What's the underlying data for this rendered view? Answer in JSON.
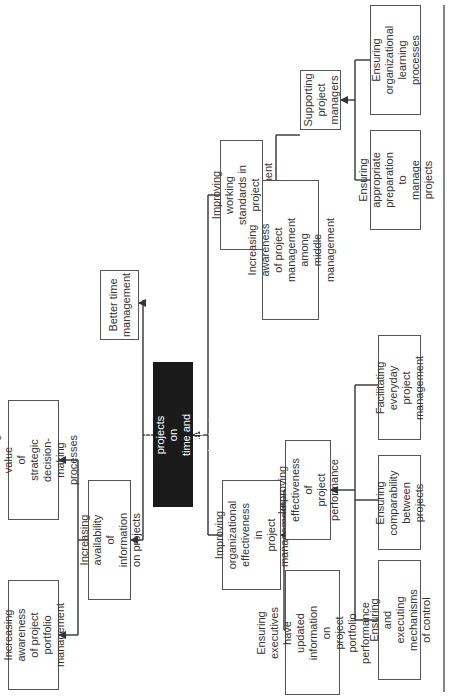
{
  "diagram": {
    "orientation": "rotated-90-ccw",
    "root": {
      "label": "Complete more projects on\ntime and within budget",
      "fill": "#1a1a1a",
      "text_color": "#ffffff"
    },
    "nodes": {
      "better_time": "Better time\nmanagement",
      "info_availability": "Increasing availability\nof information on projects",
      "strategic_value": "Increasing value\nof strategic decision-\nmaking processes",
      "portfolio_awareness": "Increasing\nawareness of project\nportfolio management",
      "working_standards": "Improving working\nstandards in\nproject management",
      "middle_mgmt_awareness": "Increasing awareness\nof project management\namong middle\nmanagement",
      "supporting_pms": "Supporting project\nmanagers",
      "appropriate_preparation": "Ensuring\nappropriate\npreparation to\nmanage projects",
      "org_learning": "Ensuring\norganizational\nlearning processes",
      "org_effectiveness": "Improving\norganizational\neffectiveness in\nproject management",
      "executives_info": "Ensuring executives have\nupdated information on\nproject portfolio performance",
      "project_performance": "Improving\neffectiveness of\nproject performance",
      "control_mechanisms": "Ensuring and executing\nmechanisms of control",
      "comparability": "Ensuring\ncomparability\nbetween projects",
      "everyday_mgmt": "Facilitating\neveryday project\nmanagement"
    },
    "edges": [
      [
        "info_availability",
        "root"
      ],
      [
        "better_time",
        "root"
      ],
      [
        "org_effectiveness",
        "root"
      ],
      [
        "working_standards",
        "root"
      ],
      [
        "strategic_value",
        "info_availability"
      ],
      [
        "portfolio_awareness",
        "info_availability"
      ],
      [
        "middle_mgmt_awareness",
        "working_standards"
      ],
      [
        "supporting_pms",
        "working_standards"
      ],
      [
        "appropriate_preparation",
        "supporting_pms"
      ],
      [
        "org_learning",
        "supporting_pms"
      ],
      [
        "executives_info",
        "org_effectiveness"
      ],
      [
        "project_performance",
        "org_effectiveness"
      ],
      [
        "control_mechanisms",
        "project_performance"
      ],
      [
        "comparability",
        "project_performance"
      ],
      [
        "everyday_mgmt",
        "project_performance"
      ]
    ],
    "colors": {
      "line": "#333333",
      "border": "#555555",
      "text": "#333333"
    }
  }
}
